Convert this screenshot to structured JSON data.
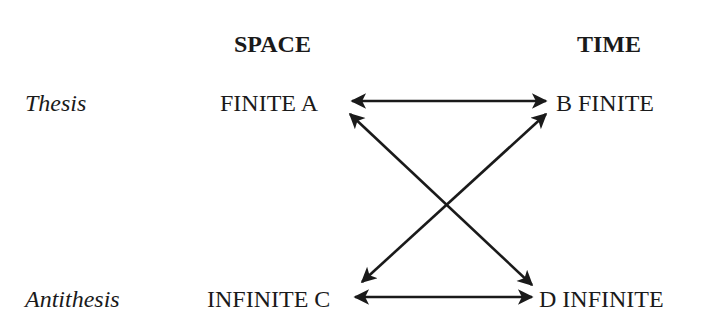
{
  "columns": {
    "space": "SPACE",
    "time": "TIME"
  },
  "rows": {
    "thesis": "Thesis",
    "antithesis": "Antithesis"
  },
  "nodes": {
    "a": "FINITE A",
    "b": "B FINITE",
    "c": "INFINITE C",
    "d": "D INFINITE"
  },
  "edges": [
    {
      "from": "A",
      "to": "B",
      "type": "bidirectional"
    },
    {
      "from": "C",
      "to": "D",
      "type": "bidirectional"
    },
    {
      "from": "A",
      "to": "D",
      "type": "bidirectional"
    },
    {
      "from": "B",
      "to": "C",
      "type": "bidirectional"
    }
  ],
  "colors": {
    "ink": "#1a1a1a",
    "background": "#ffffff"
  }
}
